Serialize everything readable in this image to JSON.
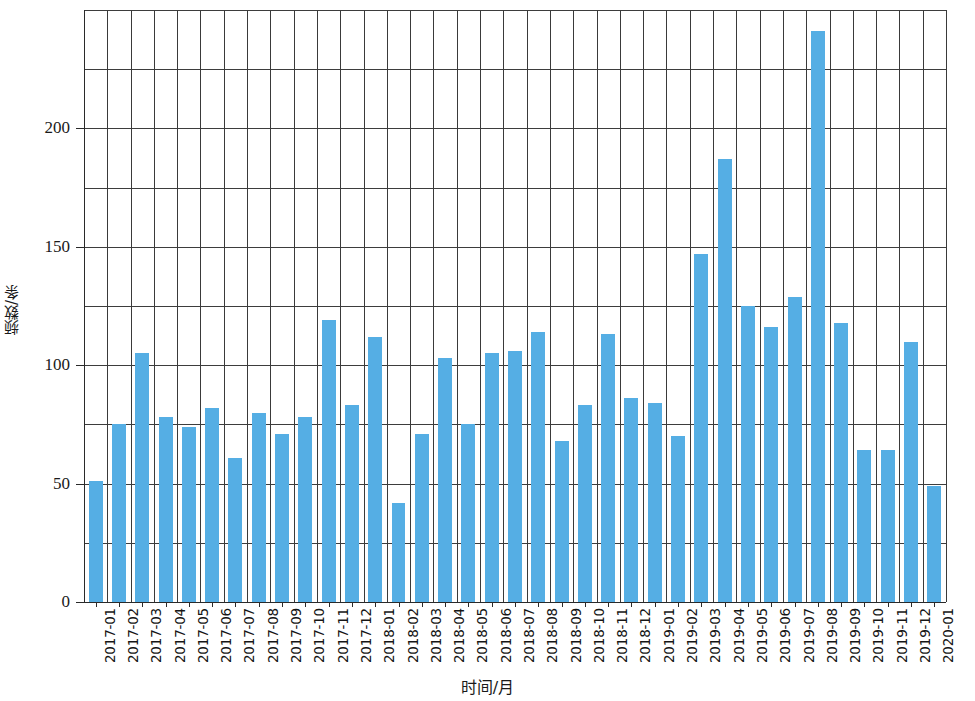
{
  "chart_data": {
    "type": "bar",
    "title": "",
    "xlabel": "时间/月",
    "ylabel": "频数/条",
    "ylim": [
      0,
      250
    ],
    "ytick_values": [
      0,
      50,
      100,
      150,
      200
    ],
    "ytick_labels": [
      "0",
      "50",
      "100",
      "150",
      "200"
    ],
    "gridline_values": [
      0,
      25,
      50,
      75,
      100,
      125,
      150,
      175,
      200,
      225,
      250
    ],
    "grid": true,
    "legend": "none",
    "bar_color": "#55aee4",
    "axis_color": "#2a2a2a",
    "grid_color": "#3d3d3d",
    "categories": [
      "2017-01",
      "2017-02",
      "2017-03",
      "2017-04",
      "2017-05",
      "2017-06",
      "2017-07",
      "2017-08",
      "2017-09",
      "2017-10",
      "2017-11",
      "2017-12",
      "2018-01",
      "2018-02",
      "2018-03",
      "2018-04",
      "2018-05",
      "2018-06",
      "2018-07",
      "2018-08",
      "2018-09",
      "2018-10",
      "2018-11",
      "2018-12",
      "2019-01",
      "2019-02",
      "2019-03",
      "2019-04",
      "2019-05",
      "2019-06",
      "2019-07",
      "2019-08",
      "2019-09",
      "2019-10",
      "2019-11",
      "2019-12",
      "2020-01"
    ],
    "values": [
      51,
      75,
      105,
      78,
      74,
      82,
      61,
      80,
      71,
      78,
      119,
      83,
      112,
      42,
      71,
      103,
      75,
      105,
      106,
      114,
      68,
      83,
      113,
      86,
      84,
      70,
      147,
      187,
      125,
      116,
      129,
      241,
      118,
      64,
      64,
      110,
      49
    ]
  }
}
